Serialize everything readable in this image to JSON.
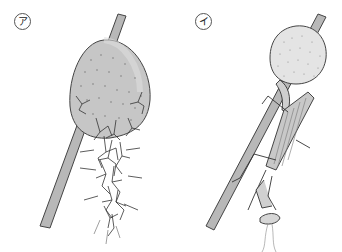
{
  "figure": {
    "panels": [
      {
        "id": "a",
        "label": "ア",
        "description": "Hatching mantis nymphs emerging from an egg case (ootheca) attached to a plant stem"
      },
      {
        "id": "b",
        "label": "イ",
        "description": "Adult mantis on a plant stem below an egg case (ootheca)"
      }
    ],
    "colors": {
      "ootheca_fill": "#c9c9c9",
      "stem_fill": "#b8b8b8",
      "outline": "#444444",
      "background": "#ffffff"
    }
  }
}
